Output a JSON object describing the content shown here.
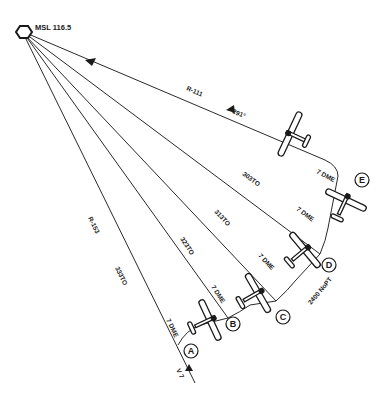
{
  "station": {
    "label": "MSL 116.5",
    "icon": "vor-hexagon-icon"
  },
  "radials": [
    {
      "id": "top",
      "label": "R-111",
      "course_label": "291°"
    },
    {
      "id": "E",
      "course_label": "303TO",
      "dme_label": "7 DME",
      "point": "E"
    },
    {
      "id": "D",
      "course_label": "313TO",
      "dme_label": "7 DME",
      "point": "D"
    },
    {
      "id": "C",
      "course_label": "323TO",
      "dme_label": "7 DME",
      "point": "C"
    },
    {
      "id": "B",
      "course_label": "333TO",
      "dme_label": "7 DME",
      "point": "B"
    },
    {
      "id": "A",
      "label": "R-153",
      "dme_label": "7 DME",
      "point": "A",
      "airway": "V 7"
    }
  ],
  "arc_points": [
    "A",
    "B",
    "C",
    "D",
    "E"
  ],
  "e_dme_label": "7 DME",
  "altitude_note": "2400 NoPT",
  "colors": {
    "line": "#2a2a2a",
    "background": "#ffffff"
  }
}
